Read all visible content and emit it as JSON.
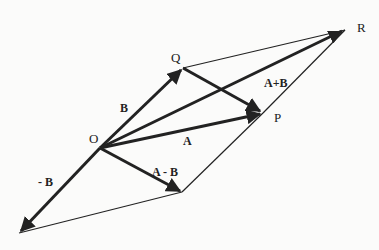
{
  "diagram": {
    "points": {
      "O": {
        "label": "O",
        "x": 100,
        "y": 148
      },
      "Q": {
        "label": "Q",
        "x": 183,
        "y": 68
      },
      "P": {
        "label": "P",
        "x": 263,
        "y": 113
      },
      "R": {
        "label": "R",
        "x": 345,
        "y": 30
      },
      "negB": {
        "x": 19,
        "y": 233
      },
      "AminusB": {
        "x": 182,
        "y": 192
      }
    },
    "vector_labels": {
      "B": "B",
      "A": "A",
      "A_plus_B": "A+B",
      "minus_B": "- B",
      "A_minus_B": "A - B"
    },
    "point_labels": {
      "O": "O",
      "Q": "Q",
      "P": "P",
      "R": "R"
    },
    "colors": {
      "line": "#222222",
      "background": "#fbfbfa"
    }
  }
}
